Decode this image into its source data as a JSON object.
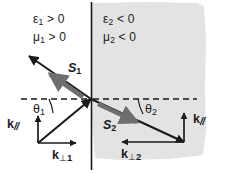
{
  "figure": {
    "background_color": "#ffffff",
    "ink_color": "#1a1a1a",
    "shaded_region_color": "#e3e3e3",
    "arrow_gray_color": "#6e6e6e"
  },
  "regions": {
    "medium1": {
      "name": "medium-1-positive-index",
      "epsilon_label": "ε₁ > 0",
      "mu_label": "μ₁ > 0",
      "epsilon_symbol": "ε",
      "epsilon_sub": "1",
      "epsilon_rel": "> 0",
      "mu_symbol": "μ",
      "mu_sub": "1",
      "mu_rel": "> 0"
    },
    "medium2": {
      "name": "medium-2-negative-index",
      "epsilon_label": "ε₂ < 0",
      "mu_label": "μ₂ < 0",
      "epsilon_symbol": "ε",
      "epsilon_sub": "2",
      "epsilon_rel": "< 0",
      "mu_symbol": "μ",
      "mu_sub": "2",
      "mu_rel": "< 0"
    }
  },
  "vectors": {
    "poynting1": {
      "symbol": "S",
      "sub": "1",
      "label": "S₁",
      "description": "Poynting vector in medium 1, points up-left away from interface"
    },
    "poynting2": {
      "symbol": "S",
      "sub": "2",
      "label": "S₂",
      "description": "Poynting vector in medium 2, points down-right"
    },
    "k_parallel_left": {
      "symbol": "k",
      "slash": "//",
      "label": "k//",
      "description": "Parallel wavevector component in medium 1, points up"
    },
    "k_parallel_right": {
      "symbol": "k",
      "slash": "//",
      "label": "k//",
      "description": "Parallel wavevector component in medium 2, points up"
    },
    "k_perp_1": {
      "symbol": "k",
      "perp": "⊥",
      "idx": "1",
      "label": "k⊥1",
      "description": "Perpendicular wavevector component in medium 1, points right"
    },
    "k_perp_2": {
      "symbol": "k",
      "perp": "⊥",
      "idx": "2",
      "label": "k⊥2",
      "description": "Perpendicular wavevector component in medium 2, points left"
    }
  },
  "angles": {
    "theta1": {
      "symbol": "θ",
      "sub": "1",
      "label": "θ₁",
      "description": "Angle of incidence measured from interface normal"
    },
    "theta2": {
      "symbol": "θ",
      "sub": "2",
      "label": "θ₂",
      "description": "Angle of refraction measured from interface normal"
    }
  },
  "geometry": {
    "interface_x": 91,
    "incidence_point": {
      "x": 91,
      "y": 99
    },
    "normal_dashed_y": 99
  }
}
